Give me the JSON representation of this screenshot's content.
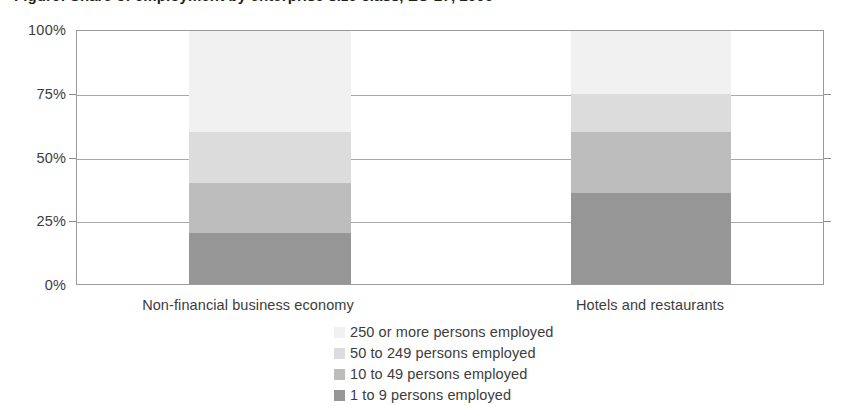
{
  "chart_data": {
    "type": "bar",
    "subtype": "stacked-percentage-column",
    "title": "Figure: Share of employment by enterprise size class, EU-27, 2006",
    "categories": [
      "Non-financial business economy",
      "Hotels and restaurants"
    ],
    "series": [
      {
        "name": "1 to 9 persons employed",
        "values": [
          20,
          36
        ],
        "color": "#969696",
        "legend_order": 4,
        "stack_order": 1
      },
      {
        "name": "10 to 49 persons employed",
        "values": [
          20,
          24
        ],
        "color": "#bdbdbd",
        "legend_order": 3,
        "stack_order": 2
      },
      {
        "name": "50 to 249 persons employed",
        "values": [
          20,
          15
        ],
        "color": "#dcdcdc",
        "legend_order": 2,
        "stack_order": 3
      },
      {
        "name": "250 or more persons employed",
        "values": [
          40,
          25
        ],
        "color": "#f1f1f1",
        "legend_order": 1,
        "stack_order": 4
      }
    ],
    "xlabel": "",
    "ylabel": "",
    "ylim": [
      0,
      100
    ],
    "yticks": [
      0,
      25,
      50,
      75,
      100
    ],
    "ytick_labels": [
      "0%",
      "25%",
      "50%",
      "75%",
      "100%"
    ],
    "grid": true,
    "legend_position": "bottom"
  },
  "axis": {
    "y_labels": [
      "100%",
      "75%",
      "50%",
      "25%",
      "0%"
    ]
  },
  "legend": {
    "items": [
      {
        "label": "250 or more persons employed",
        "color": "#f1f1f1"
      },
      {
        "label": "50 to 249 persons employed",
        "color": "#dcdcdc"
      },
      {
        "label": "10 to 49 persons employed",
        "color": "#bdbdbd"
      },
      {
        "label": "1 to 9 persons employed",
        "color": "#969696"
      }
    ]
  },
  "colors": {
    "axis_line": "#9a9a9a",
    "gridline": "#a8a8a8",
    "text": "#3c3c3c",
    "background": "#ffffff"
  }
}
